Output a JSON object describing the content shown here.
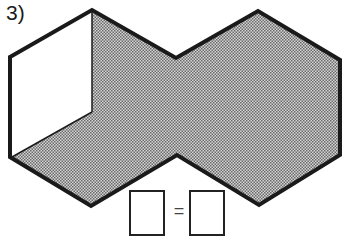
{
  "question": {
    "number_label": "3)"
  },
  "figure": {
    "fill_color": "#a8a8a8",
    "outline_color": "#1a1a1a",
    "wall_color": "#ffffff"
  },
  "answer": {
    "left_box_value": "",
    "operator": "=",
    "right_box_value": ""
  }
}
